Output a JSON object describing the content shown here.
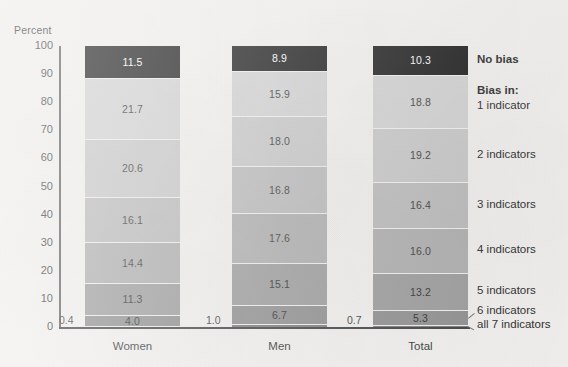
{
  "chart_data": {
    "type": "bar",
    "subtype": "stacked-bar-100",
    "title": "",
    "ylabel": "Percent",
    "xlabel": "",
    "ylim": [
      0,
      100
    ],
    "yticks": [
      0,
      10,
      20,
      30,
      40,
      50,
      60,
      70,
      80,
      90,
      100
    ],
    "ytick_labels": [
      "0",
      "10",
      "20",
      "30",
      "40",
      "50",
      "60",
      "70",
      "80",
      "90",
      "100"
    ],
    "grid": false,
    "legend_position": "right",
    "categories": [
      "Women",
      "Men",
      "Total"
    ],
    "series": [
      {
        "name": "No bias",
        "color": "#1a1a1a",
        "label_color": "#ffffff",
        "values": [
          11.5,
          8.9,
          10.3
        ]
      },
      {
        "name": "1 indicator",
        "color": "#d4d4d4",
        "label_color": "#3a3a3a",
        "values": [
          21.7,
          15.9,
          18.8
        ]
      },
      {
        "name": "2 indicators",
        "color": "#cacaca",
        "label_color": "#3a3a3a",
        "values": [
          20.6,
          18.0,
          19.2
        ]
      },
      {
        "name": "3 indicators",
        "color": "#bdbdbd",
        "label_color": "#3a3a3a",
        "values": [
          16.1,
          16.8,
          16.4
        ]
      },
      {
        "name": "4 indicators",
        "color": "#b0b0b0",
        "label_color": "#3a3a3a",
        "values": [
          14.4,
          17.6,
          16.0
        ]
      },
      {
        "name": "5 indicators",
        "color": "#9e9e9e",
        "label_color": "#2e2e2e",
        "values": [
          11.3,
          15.1,
          13.2
        ]
      },
      {
        "name": "6 indicators",
        "color": "#909090",
        "label_color": "#2e2e2e",
        "values": [
          4.0,
          6.7,
          5.3
        ]
      },
      {
        "name": "all 7 indicators",
        "color": "#7d7d7d",
        "label_color": "#2e2e2e",
        "values": [
          0.4,
          1.0,
          0.7
        ]
      }
    ],
    "annotations": [
      {
        "text": "0.4",
        "series": "all 7 indicators",
        "category": "Women",
        "placement": "outside-left"
      },
      {
        "text": "1.0",
        "series": "all 7 indicators",
        "category": "Men",
        "placement": "outside-left"
      },
      {
        "text": "0.7",
        "series": "all 7 indicators",
        "category": "Total",
        "placement": "outside-left"
      }
    ]
  },
  "legend": {
    "entries": [
      {
        "label": "No bias",
        "bold": true
      },
      {
        "label": "Bias in:",
        "bold": true
      },
      {
        "label": "1 indicator",
        "bold": false
      },
      {
        "label": "2 indicators",
        "bold": false
      },
      {
        "label": "3 indicators",
        "bold": false
      },
      {
        "label": "4 indicators",
        "bold": false
      },
      {
        "label": "5 indicators",
        "bold": false
      },
      {
        "label": "6 indicators",
        "bold": false
      },
      {
        "label": "all 7 indicators",
        "bold": false
      }
    ]
  },
  "value_labels": {
    "women": [
      "11.5",
      "21.7",
      "20.6",
      "16.1",
      "14.4",
      "11.3",
      "4.0",
      "0.4"
    ],
    "men": [
      "8.9",
      "15.9",
      "18.0",
      "16.8",
      "17.6",
      "15.1",
      "6.7",
      "1.0"
    ],
    "total": [
      "10.3",
      "18.8",
      "19.2",
      "16.4",
      "16.0",
      "13.2",
      "5.3",
      "0.7"
    ]
  },
  "colors": {
    "background": "#f4f3f1",
    "axis": "#3f3f3f",
    "text": "#2e2e2e",
    "no_bias": "#1a1a1a"
  }
}
